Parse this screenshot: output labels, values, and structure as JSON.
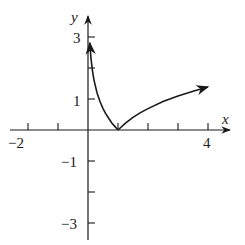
{
  "chart_data": {
    "type": "line",
    "title": "",
    "xlabel": "x",
    "ylabel": "y",
    "xlim": [
      -2.9,
      4.8
    ],
    "ylim": [
      -3.7,
      3.7
    ],
    "x_ticks": [
      -2,
      -1,
      1,
      2,
      3,
      4
    ],
    "y_ticks": [
      -3,
      -2,
      -1,
      1,
      2,
      3
    ],
    "x_tick_labels": [
      {
        "value": -2,
        "label": "−2"
      },
      {
        "value": 4,
        "label": "4"
      }
    ],
    "y_tick_labels": [
      {
        "value": 3,
        "label": "3"
      },
      {
        "value": 1,
        "label": "1"
      },
      {
        "value": -1,
        "label": "−1"
      },
      {
        "value": -3,
        "label": "−3"
      }
    ],
    "grid": false,
    "series": [
      {
        "name": "y = |ln x|",
        "x": [
          0.06,
          0.1,
          0.15,
          0.2,
          0.3,
          0.4,
          0.5,
          0.6,
          0.7,
          0.8,
          0.9,
          1.0,
          1.25,
          1.5,
          1.75,
          2.0,
          2.5,
          3.0,
          3.5,
          4.0
        ],
        "y": [
          2.81,
          2.3,
          1.9,
          1.61,
          1.2,
          0.92,
          0.69,
          0.51,
          0.36,
          0.22,
          0.11,
          0.0,
          0.22,
          0.41,
          0.56,
          0.69,
          0.92,
          1.1,
          1.25,
          1.39
        ],
        "arrows": [
          "start",
          "end"
        ]
      }
    ]
  },
  "labels": {
    "x_axis": "x",
    "y_axis": "y",
    "x_neg2": "−2",
    "x_4": "4",
    "y_3": "3",
    "y_1": "1",
    "y_neg1": "−1",
    "y_neg3": "−3"
  }
}
